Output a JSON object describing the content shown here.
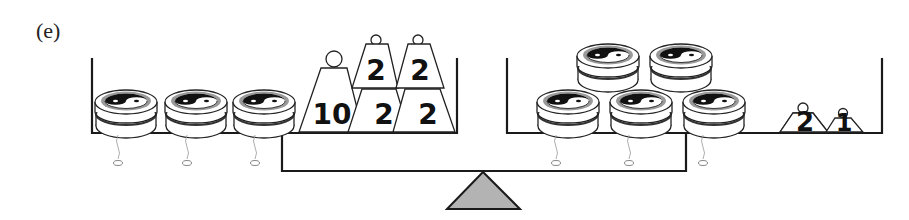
{
  "figure": {
    "label": "(e)"
  },
  "left_pan": {
    "discs": [
      {
        "id": "disc-1",
        "count": 1
      },
      {
        "id": "disc-2",
        "count": 1
      },
      {
        "id": "disc-3",
        "count": 1
      }
    ],
    "weights": [
      {
        "label": "10",
        "position": "bottom-left"
      },
      {
        "label": "2",
        "position": "bottom-middle"
      },
      {
        "label": "2",
        "position": "bottom-right"
      },
      {
        "label": "2",
        "position": "top-left"
      },
      {
        "label": "2",
        "position": "top-right"
      }
    ]
  },
  "right_pan": {
    "discs_bottom_row": 3,
    "discs_top_row": 2,
    "weights": [
      {
        "label": "2"
      },
      {
        "label": "1"
      }
    ]
  },
  "colors": {
    "line": "#1a1a1a",
    "fulcrum_fill": "#b3b3b3",
    "disc_ring": "#9a9a9a",
    "background": "#ffffff"
  }
}
